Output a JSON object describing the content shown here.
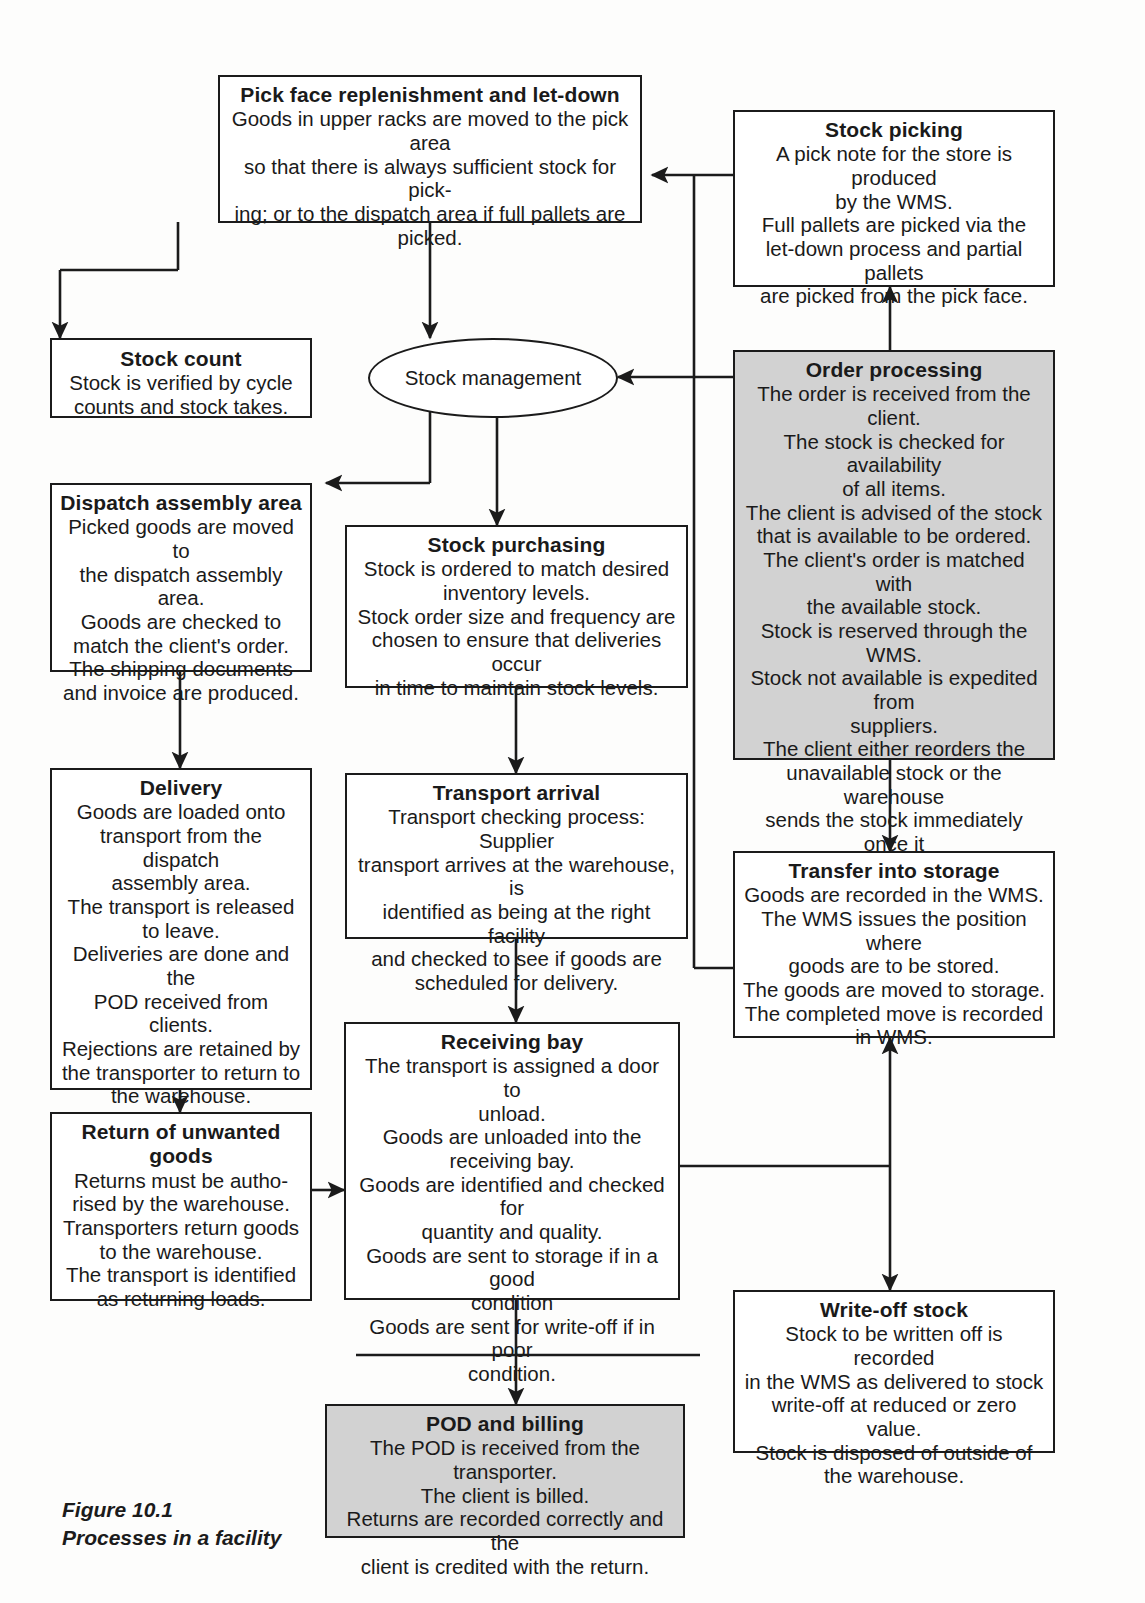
{
  "figure": {
    "caption_line1": "Figure 10.1",
    "caption_line2": "Processes in a facility",
    "caption": "Figure 10.1\nProcesses in a facility"
  },
  "colors": {
    "line": "#1b1b1b",
    "box_fill": "#ffffff",
    "shaded_fill": "#d2d2d2",
    "page": "#fdfdfc"
  },
  "nodes": {
    "pick_face": {
      "title": "Pick face replenishment and let-down",
      "body": "Goods in upper racks are moved to the pick area\nso that there is always sufficient stock for pick-\ning; or to the dispatch area if full pallets are\npicked.",
      "shaded": false
    },
    "stock_picking": {
      "title": "Stock picking",
      "body": "A pick note for the store is produced\nby the WMS.\nFull pallets are picked via the\nlet-down process and partial pallets\nare picked from the pick face.",
      "shaded": false
    },
    "stock_count": {
      "title": "Stock count",
      "body": "Stock is verified by cycle\ncounts and stock takes.",
      "shaded": false
    },
    "stock_management": {
      "title": "Stock management",
      "body": "",
      "shaded": false
    },
    "order_processing": {
      "title": "Order processing",
      "body": "The order is received from the client.\nThe stock is checked for availability\nof all items.\nThe client is advised of the stock\nthat is available to be ordered.\nThe client's order is matched with\nthe available stock.\nStock is reserved through the WMS.\nStock not available is expedited from\nsuppliers.\nThe client either reorders the\nunavailable stock or the warehouse\nsends the stock immediately once it\nis received (back-order).",
      "shaded": true
    },
    "dispatch_assembly": {
      "title": "Dispatch assembly area",
      "body": "Picked goods are moved to\nthe dispatch assembly area.\nGoods are checked to\nmatch the client's order.\nThe shipping documents\nand invoice are produced.",
      "shaded": false
    },
    "stock_purchasing": {
      "title": "Stock purchasing",
      "body": "Stock is ordered to match desired\ninventory levels.\nStock order size and frequency are\nchosen to ensure that deliveries occur\nin time to maintain stock levels.",
      "shaded": false
    },
    "delivery": {
      "title": "Delivery",
      "body": "Goods are loaded onto\ntransport from the dispatch\nassembly area.\nThe transport is released\nto leave.\nDeliveries are done and the\nPOD received from clients.\nRejections are retained by\nthe transporter to return to\nthe warehouse.",
      "shaded": false
    },
    "transport_arrival": {
      "title": "Transport  arrival",
      "body": "Transport checking process: Supplier\ntransport arrives at the warehouse, is\nidentified as being at the right facility\nand checked to see if goods are\nscheduled for delivery.",
      "shaded": false
    },
    "transfer_into_storage": {
      "title": "Transfer into storage",
      "body": "Goods are recorded in the WMS.\nThe WMS issues the position where\ngoods are to be stored.\nThe goods are moved to storage.\nThe completed move is recorded\nin WMS.",
      "shaded": false
    },
    "return_unwanted": {
      "title": "Return of unwanted goods",
      "body": "Returns must be autho-\nrised by the warehouse.\nTransporters return goods\nto the warehouse.\nThe transport is identified\nas returning loads.",
      "shaded": false
    },
    "receiving_bay": {
      "title": "Receiving bay",
      "body": "The transport is assigned a door to\nunload.\nGoods are unloaded into the\nreceiving bay.\nGoods are identified and checked for\nquantity and quality.\nGoods are sent to storage if in a good\ncondition\nGoods are sent for write-off if in poor\ncondition.",
      "shaded": false
    },
    "write_off": {
      "title": "Write-off stock",
      "body": "Stock to be written off is recorded\nin the WMS as delivered to stock\nwrite-off at reduced or zero value.\nStock is disposed of outside of\nthe warehouse.",
      "shaded": false
    },
    "pod_billing": {
      "title": "POD and billing",
      "body": "The POD is received from the transporter.\nThe client is billed.\nReturns are recorded correctly and the\nclient is credited with the return.",
      "shaded": true
    }
  },
  "flows": [
    {
      "from": "stock_picking",
      "to": "pick_face"
    },
    {
      "from": "stock_picking",
      "to": "stock_management"
    },
    {
      "from": "order_processing",
      "to": "stock_management"
    },
    {
      "from": "order_processing",
      "to": "stock_picking"
    },
    {
      "from": "order_processing",
      "to": "transfer_into_storage"
    },
    {
      "from": "pick_face",
      "to": "stock_management"
    },
    {
      "from": "pick_face",
      "to": "stock_count"
    },
    {
      "from": "pick_face",
      "to": "dispatch_assembly"
    },
    {
      "from": "stock_management",
      "to": "stock_purchasing"
    },
    {
      "from": "dispatch_assembly",
      "to": "delivery"
    },
    {
      "from": "stock_purchasing",
      "to": "transport_arrival"
    },
    {
      "from": "delivery",
      "to": "return_unwanted"
    },
    {
      "from": "transport_arrival",
      "to": "receiving_bay"
    },
    {
      "from": "return_unwanted",
      "to": "receiving_bay"
    },
    {
      "from": "receiving_bay",
      "to": "transfer_into_storage"
    },
    {
      "from": "receiving_bay",
      "to": "write_off"
    },
    {
      "from": "receiving_bay",
      "to": "pod_billing"
    },
    {
      "from": "delivery",
      "to": "pod_billing"
    }
  ]
}
